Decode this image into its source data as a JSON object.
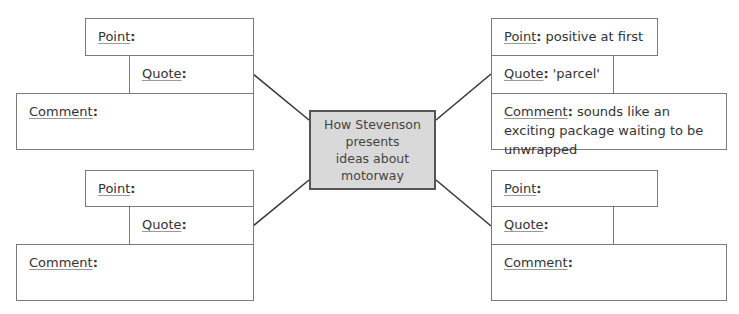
{
  "center": {
    "lines": [
      "How Stevenson",
      "presents",
      "ideas about",
      "motorway"
    ],
    "fill": "#d9d9d9"
  },
  "labels": {
    "point": "Point",
    "quote": "Quote",
    "comment": "Comment",
    "colon": ":"
  },
  "quadrants": {
    "top_left": {
      "point": "",
      "quote": "",
      "comment": ""
    },
    "top_right": {
      "point": "positive at first",
      "quote": "'parcel'",
      "comment": "sounds like an exciting package waiting to be unwrapped"
    },
    "bottom_left": {
      "point": "",
      "quote": "",
      "comment": ""
    },
    "bottom_right": {
      "point": "",
      "quote": "",
      "comment": ""
    }
  }
}
